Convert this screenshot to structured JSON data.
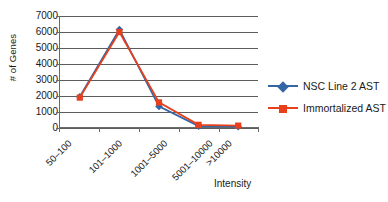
{
  "chart_data": {
    "type": "line",
    "title": "",
    "subtitle": "",
    "xlabel": "Intensity",
    "ylabel": "# of Genes",
    "categories": [
      "50–100",
      "101–1000",
      "1001–5000",
      "5001–10000",
      ">10000"
    ],
    "series": [
      {
        "name": "NSC Line 2 AST",
        "color": "#3465a4",
        "marker": "diamond",
        "values": [
          1950,
          6150,
          1350,
          120,
          80
        ]
      },
      {
        "name": "Immortalized AST",
        "color": "#e8401c",
        "marker": "square",
        "values": [
          1900,
          6000,
          1600,
          200,
          150
        ]
      }
    ],
    "ylim": [
      0,
      7000
    ],
    "ytick_step": 1000,
    "yticks": [
      "0",
      "1000",
      "2000",
      "3000",
      "4000",
      "5000",
      "6000",
      "7000"
    ],
    "grid": "horizontal",
    "legend_position": "right",
    "plot_background": "#ffffff",
    "gridline_color": "#5c5c5c",
    "axis_color": "#6b6b6b"
  },
  "legend": {
    "items": [
      {
        "label": "NSC Line 2 AST"
      },
      {
        "label": "Immortalized AST"
      }
    ]
  }
}
